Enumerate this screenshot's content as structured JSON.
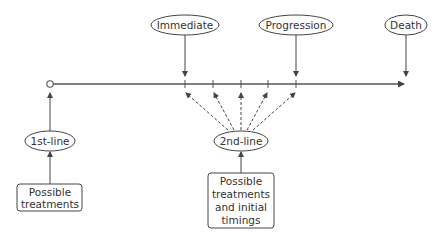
{
  "diagram": {
    "events": [
      {
        "label": "Immediate",
        "x": 185
      },
      {
        "label": "Progression",
        "x": 296
      },
      {
        "label": "Death",
        "x": 406
      }
    ],
    "first_line": {
      "label": "1st-line",
      "box_lines": [
        "Possible",
        "treatments"
      ]
    },
    "second_line": {
      "label": "2nd-line",
      "box_lines": [
        "Possible",
        "treatments",
        "and initial",
        "timings"
      ]
    },
    "colors": {
      "stroke": "#444444",
      "text": "#333333"
    }
  }
}
